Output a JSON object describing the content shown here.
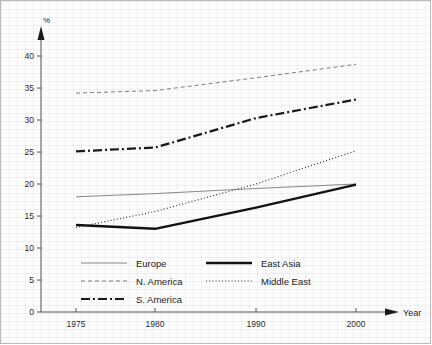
{
  "chart_data": {
    "type": "line",
    "title": "",
    "xlabel": "Year",
    "ylabel": "%",
    "x": [
      1975,
      1980,
      1990,
      2000
    ],
    "xticklabels": [
      "1975",
      "1980",
      "1990",
      "2000"
    ],
    "ylim": [
      0,
      40
    ],
    "yticks": [
      0,
      5,
      10,
      15,
      20,
      25,
      30,
      35,
      40
    ],
    "yticklabels": [
      "0",
      "5",
      "10",
      "15",
      "20",
      "25",
      "30",
      "35",
      "40"
    ],
    "grid": true,
    "legend_position": "inside-bottom-left",
    "series": [
      {
        "name": "Europe",
        "style": "solid-thin",
        "color": "#7a7a7a",
        "values": [
          18.0,
          18.5,
          19.3,
          20.0
        ]
      },
      {
        "name": "N. America",
        "style": "dashed",
        "color": "#6e6e6e",
        "values": [
          34.2,
          34.6,
          36.6,
          38.7
        ]
      },
      {
        "name": "S. America",
        "style": "dash-dot",
        "color": "#1a1a1a",
        "values": [
          25.1,
          25.7,
          30.3,
          33.2
        ]
      },
      {
        "name": "East Asia",
        "style": "solid-thick",
        "color": "#111111",
        "values": [
          13.6,
          13.0,
          16.3,
          19.9
        ]
      },
      {
        "name": "Middle East",
        "style": "dotted",
        "color": "#3a3a3a",
        "values": [
          13.2,
          15.7,
          20.0,
          25.2
        ]
      }
    ]
  },
  "legend": {
    "entries": [
      {
        "label": "Europe"
      },
      {
        "label": "N. America"
      },
      {
        "label": "S. America"
      },
      {
        "label": "East Asia"
      },
      {
        "label": "Middle East"
      }
    ]
  },
  "axes": {
    "y_unit": "%",
    "x_title": "Year"
  }
}
